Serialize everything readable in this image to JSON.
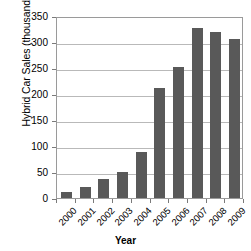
{
  "chart_data": {
    "type": "bar",
    "title": "",
    "xlabel": "Year",
    "ylabel": "Hybrid Car Sales (thousands)",
    "categories": [
      "2000",
      "2001",
      "2002",
      "2003",
      "2004",
      "2005",
      "2006",
      "2007",
      "2008",
      "2009"
    ],
    "values": [
      11,
      21,
      36,
      50,
      88,
      211,
      251,
      327,
      319,
      305
    ],
    "series": [
      {
        "name": "Hybrid Car Sales",
        "values": [
          11,
          21,
          36,
          50,
          88,
          211,
          251,
          327,
          319,
          305
        ]
      }
    ],
    "ylim": [
      0,
      350
    ],
    "ytick_values": [
      0,
      50,
      100,
      150,
      200,
      250,
      300,
      350
    ],
    "ytick_labels": [
      "0",
      "50",
      "100",
      "150",
      "200",
      "250",
      "300",
      "350"
    ],
    "grid": true,
    "grid_axis": "y",
    "legend": false,
    "legend_position": "none",
    "bar_color": "#595959",
    "gridline_color": "#b9b9b9",
    "axis_color": "#9a9a9a",
    "background_color": "#ffffff",
    "xtick_rotation": -45
  }
}
